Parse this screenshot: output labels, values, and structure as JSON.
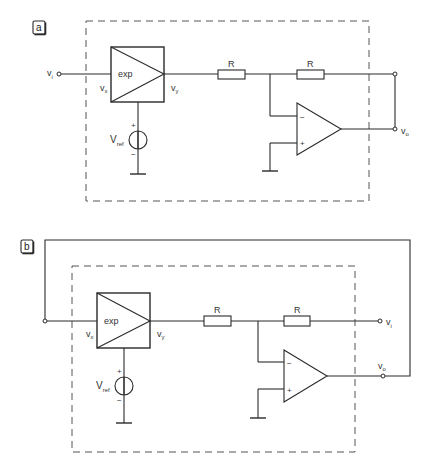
{
  "diagrams": [
    {
      "id": "a",
      "tag": "a",
      "block_label": "exp",
      "block_input_label": "v",
      "block_input_sub": "x",
      "block_output_label": "v",
      "block_output_sub": "y",
      "input_label": "v",
      "input_sub": "i",
      "output_label": "v",
      "output_sub": "o",
      "source_label": "V",
      "source_sub": "ref",
      "source_plus": "+",
      "source_minus": "−",
      "resistor1_label": "R",
      "resistor2_label": "R",
      "opamp_minus": "−",
      "opamp_plus": "+"
    },
    {
      "id": "b",
      "tag": "b",
      "block_label": "exp",
      "block_input_label": "v",
      "block_input_sub": "x",
      "block_output_label": "v",
      "block_output_sub": "y",
      "input_label": "v",
      "input_sub": "i",
      "output_label": "v",
      "output_sub": "o",
      "source_label": "V",
      "source_sub": "ref",
      "source_plus": "+",
      "source_minus": "−",
      "resistor1_label": "R",
      "resistor2_label": "R",
      "opamp_minus": "−",
      "opamp_plus": "+"
    }
  ]
}
